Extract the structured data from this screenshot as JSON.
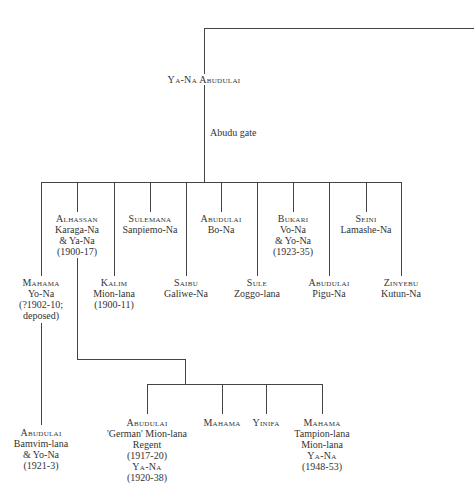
{
  "root": {
    "name": "Ya-Na Abudulai",
    "gate_label": "Abudu gate"
  },
  "sons": [
    {
      "name": "Mahama",
      "lines": [
        "Yo-Na",
        "(?1902-10;",
        "deposed)"
      ]
    },
    {
      "name": "Alhassan",
      "lines": [
        "Karaga-Na",
        "& Ya-Na",
        "(1900-17)"
      ]
    },
    {
      "name": "Kalim",
      "lines": [
        "Mion-lana",
        "(1900-11)"
      ]
    },
    {
      "name": "Sulemana",
      "lines": [
        "Sanpiemo-Na"
      ]
    },
    {
      "name": "Saibu",
      "lines": [
        "Galiwe-Na"
      ]
    },
    {
      "name": "Abudulai",
      "lines": [
        "Bo-Na"
      ]
    },
    {
      "name": "Sule",
      "lines": [
        "Zoggo-lana"
      ]
    },
    {
      "name": "Bukari",
      "lines": [
        "Vo-Na",
        "& Yo-Na",
        "(1923-35)"
      ]
    },
    {
      "name": "Abudulai",
      "lines": [
        "Pigu-Na"
      ]
    },
    {
      "name": "Seini",
      "lines": [
        "Lamashe-Na"
      ]
    },
    {
      "name": "Zinyebu",
      "lines": [
        "Kutun-Na"
      ]
    }
  ],
  "grandsons_mahama": [
    {
      "name": "Abudulai",
      "lines": [
        "Bamvim-lana",
        "& Yo-Na",
        "(1921-3)"
      ]
    }
  ],
  "grandsons_alhassan": [
    {
      "name": "Abudulai",
      "lines": [
        "'German' Mion-lana",
        "Regent",
        "(1917-20)",
        "Ya-Na",
        "(1920-38)"
      ]
    },
    {
      "name": "Mahama",
      "lines": []
    },
    {
      "name": "Yinifa",
      "lines": []
    },
    {
      "name": "Mahama",
      "lines": [
        "Tampion-lana",
        "Mion-lana",
        "Ya-Na",
        "(1948-53)"
      ]
    }
  ]
}
